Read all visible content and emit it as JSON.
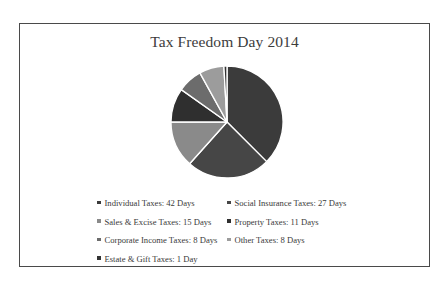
{
  "chart_data": {
    "type": "pie",
    "title": "Tax Freedom Day 2014",
    "categories": [
      "Individual Taxes",
      "Social Insurance Taxes",
      "Sales & Excise Taxes",
      "Property Taxes",
      "Corporate Income Taxes",
      "Other Taxes",
      "Estate & Gift Taxes"
    ],
    "values": [
      42,
      27,
      15,
      11,
      8,
      8,
      1
    ],
    "unit": "Days",
    "colors": [
      "#3b3b3b",
      "#464646",
      "#8a8a8a",
      "#2f2f2f",
      "#6c6c6c",
      "#9c9c9c",
      "#333333"
    ],
    "legend_labels": [
      "Individual Taxes: 42 Days",
      "Social Insurance Taxes: 27 Days",
      "Sales & Excise Taxes: 15 Days",
      "Property Taxes: 11 Days",
      "Corporate Income Taxes: 8 Days",
      "Other Taxes: 8 Days",
      "Estate & Gift Taxes:  1 Day"
    ],
    "legend_position": "bottom",
    "start_angle": "12 o'clock",
    "direction": "clockwise"
  },
  "title": "Tax Freedom Day 2014",
  "legend": {
    "rows": [
      [
        {
          "label": "Individual Taxes: 42 Days",
          "color": "#3b3b3b"
        },
        {
          "label": "Social Insurance Taxes: 27 Days",
          "color": "#464646"
        }
      ],
      [
        {
          "label": "Sales & Excise Taxes: 15 Days",
          "color": "#8a8a8a"
        },
        {
          "label": "Property Taxes: 11 Days",
          "color": "#2f2f2f"
        }
      ],
      [
        {
          "label": "Corporate Income Taxes: 8 Days",
          "color": "#6c6c6c"
        },
        {
          "label": "Other Taxes: 8 Days",
          "color": "#9c9c9c"
        }
      ],
      [
        {
          "label": "Estate & Gift Taxes:  1 Day",
          "color": "#333333"
        }
      ]
    ]
  }
}
